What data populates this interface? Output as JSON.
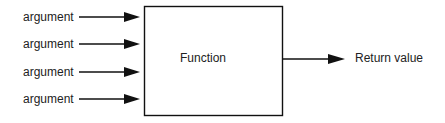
{
  "diagram": {
    "inputs": [
      {
        "label": "argument"
      },
      {
        "label": "argument"
      },
      {
        "label": "argument"
      },
      {
        "label": "argument"
      }
    ],
    "function_box": {
      "label": "Function"
    },
    "output": {
      "label": "Return value"
    },
    "colors": {
      "stroke": "#111111",
      "text": "#222222",
      "background": "#ffffff"
    }
  }
}
